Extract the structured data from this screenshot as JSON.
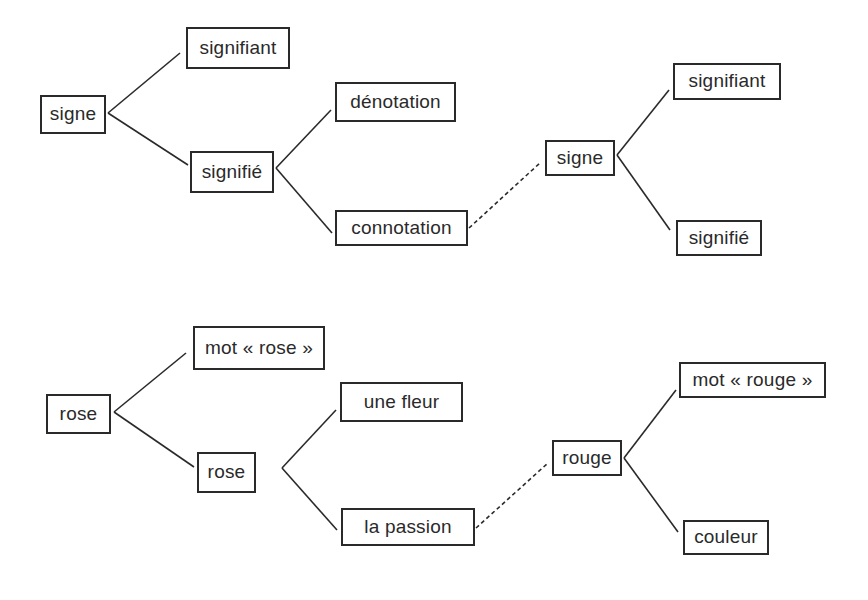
{
  "diagram": {
    "type": "semiotic-tree",
    "colors": {
      "ink": "#2a2a2a",
      "background": "#ffffff"
    },
    "top": {
      "nodes": [
        {
          "id": "signe",
          "label": "signe",
          "x": 40,
          "y": 95,
          "w": 66,
          "h": 39
        },
        {
          "id": "signifiant",
          "label": "signifiant",
          "x": 186,
          "y": 27,
          "w": 104,
          "h": 42
        },
        {
          "id": "signifie",
          "label": "signifié",
          "x": 190,
          "y": 151,
          "w": 84,
          "h": 42
        },
        {
          "id": "denotation",
          "label": "dénotation",
          "x": 335,
          "y": 82,
          "w": 121,
          "h": 40
        },
        {
          "id": "connotation",
          "label": "connotation",
          "x": 335,
          "y": 210,
          "w": 133,
          "h": 36
        },
        {
          "id": "signe2",
          "label": "signe",
          "x": 545,
          "y": 140,
          "w": 70,
          "h": 36
        },
        {
          "id": "signifiant2",
          "label": "signifiant",
          "x": 673,
          "y": 63,
          "w": 108,
          "h": 37
        },
        {
          "id": "signifie2",
          "label": "signifié",
          "x": 676,
          "y": 220,
          "w": 86,
          "h": 36
        }
      ],
      "edges": [
        {
          "from": "signe",
          "to": "signifiant",
          "style": "solid",
          "x1": 108,
          "y1": 113,
          "x2": 180,
          "y2": 53
        },
        {
          "from": "signe",
          "to": "signifie",
          "style": "solid",
          "x1": 108,
          "y1": 113,
          "x2": 188,
          "y2": 165
        },
        {
          "from": "signifie",
          "to": "denotation",
          "style": "solid",
          "x1": 276,
          "y1": 168,
          "x2": 331,
          "y2": 110
        },
        {
          "from": "signifie",
          "to": "connotation",
          "style": "solid",
          "x1": 276,
          "y1": 168,
          "x2": 332,
          "y2": 233
        },
        {
          "from": "connotation",
          "to": "signe2",
          "style": "dashed",
          "x1": 469,
          "y1": 228,
          "x2": 541,
          "y2": 162
        },
        {
          "from": "signe2",
          "to": "signifiant2",
          "style": "solid",
          "x1": 617,
          "y1": 155,
          "x2": 669,
          "y2": 90
        },
        {
          "from": "signe2",
          "to": "signifie2",
          "style": "solid",
          "x1": 617,
          "y1": 155,
          "x2": 670,
          "y2": 230
        }
      ]
    },
    "bottom": {
      "nodes": [
        {
          "id": "rose",
          "label": "rose",
          "x": 46,
          "y": 394,
          "w": 65,
          "h": 40
        },
        {
          "id": "mot_rose",
          "label": "mot « rose »",
          "x": 193,
          "y": 326,
          "w": 132,
          "h": 44
        },
        {
          "id": "rose2",
          "label": "rose",
          "x": 197,
          "y": 452,
          "w": 59,
          "h": 41
        },
        {
          "id": "une_fleur",
          "label": "une fleur",
          "x": 340,
          "y": 382,
          "w": 123,
          "h": 40
        },
        {
          "id": "la_passion",
          "label": "la passion",
          "x": 341,
          "y": 508,
          "w": 134,
          "h": 38
        },
        {
          "id": "rouge",
          "label": "rouge",
          "x": 552,
          "y": 440,
          "w": 70,
          "h": 36
        },
        {
          "id": "mot_rouge",
          "label": "mot « rouge »",
          "x": 679,
          "y": 362,
          "w": 147,
          "h": 36
        },
        {
          "id": "couleur",
          "label": "couleur",
          "x": 683,
          "y": 520,
          "w": 86,
          "h": 35
        }
      ],
      "edges": [
        {
          "from": "rose",
          "to": "mot_rose",
          "style": "solid",
          "x1": 114,
          "y1": 412,
          "x2": 186,
          "y2": 353
        },
        {
          "from": "rose",
          "to": "rose2",
          "style": "solid",
          "x1": 114,
          "y1": 412,
          "x2": 194,
          "y2": 467
        },
        {
          "from": "rose2",
          "to": "une_fleur",
          "style": "solid",
          "x1": 282,
          "y1": 468,
          "x2": 336,
          "y2": 410
        },
        {
          "from": "rose2",
          "to": "la_passion",
          "style": "solid",
          "x1": 282,
          "y1": 468,
          "x2": 337,
          "y2": 530
        },
        {
          "from": "la_passion",
          "to": "rouge",
          "style": "dashed",
          "x1": 476,
          "y1": 528,
          "x2": 548,
          "y2": 463
        },
        {
          "from": "rouge",
          "to": "mot_rouge",
          "style": "solid",
          "x1": 624,
          "y1": 458,
          "x2": 676,
          "y2": 390
        },
        {
          "from": "rouge",
          "to": "couleur",
          "style": "solid",
          "x1": 624,
          "y1": 458,
          "x2": 678,
          "y2": 532
        }
      ]
    }
  }
}
